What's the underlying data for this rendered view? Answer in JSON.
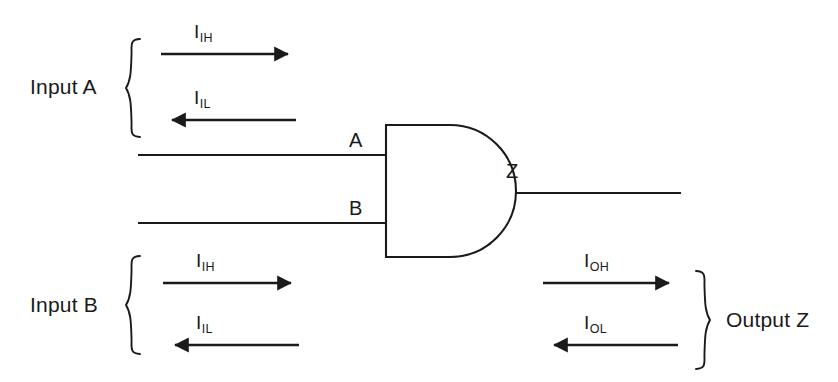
{
  "figure": {
    "kind": "logic-gate-current-diagram",
    "ink_color": "#1a1a1a",
    "background_color": "#ffffff",
    "gate": {
      "type": "AND",
      "input_pins": [
        {
          "name": "A",
          "label": "A"
        },
        {
          "name": "B",
          "label": "B"
        }
      ],
      "output_pin": {
        "name": "Z",
        "label": "Z"
      }
    },
    "groups": [
      {
        "id": "input-a",
        "label": "Input A",
        "brace_direction": "right-opening",
        "currents": [
          {
            "id": "iih-a",
            "symbol": "I",
            "subscript": "IH",
            "direction": "right"
          },
          {
            "id": "iil-a",
            "symbol": "I",
            "subscript": "IL",
            "direction": "left"
          }
        ]
      },
      {
        "id": "input-b",
        "label": "Input B",
        "brace_direction": "right-opening",
        "currents": [
          {
            "id": "iih-b",
            "symbol": "I",
            "subscript": "IH",
            "direction": "right"
          },
          {
            "id": "iil-b",
            "symbol": "I",
            "subscript": "IL",
            "direction": "left"
          }
        ]
      },
      {
        "id": "output-z",
        "label": "Output Z",
        "brace_direction": "left-opening",
        "currents": [
          {
            "id": "ioh",
            "symbol": "I",
            "subscript": "OH",
            "direction": "right"
          },
          {
            "id": "iol",
            "symbol": "I",
            "subscript": "OL",
            "direction": "left"
          }
        ]
      }
    ]
  },
  "labels": {
    "input_a_group": "Input A",
    "input_b_group": "Input B",
    "output_z_group": "Output Z",
    "pin_a": "A",
    "pin_b": "B",
    "pin_z": "Z",
    "current_symbol": "I",
    "sub_ih": "IH",
    "sub_il": "IL",
    "sub_oh": "OH",
    "sub_ol": "OL"
  }
}
